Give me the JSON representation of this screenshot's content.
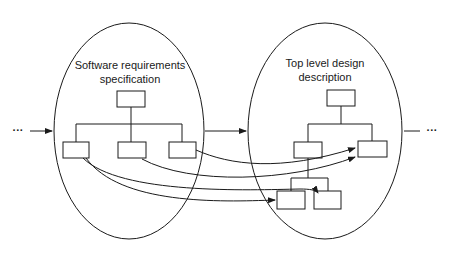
{
  "diagram": {
    "left_stage": {
      "title_line1": "Software requirements",
      "title_line2": "specification"
    },
    "right_stage": {
      "title_line1": "Top level design",
      "title_line2": "description"
    },
    "ellipsis_in": "···",
    "ellipsis_out": "···",
    "colors": {
      "stroke": "#1a1a1a",
      "background": "#ffffff"
    }
  }
}
